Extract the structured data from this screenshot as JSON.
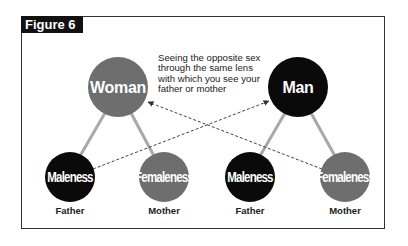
{
  "figure": {
    "title": "Figure 6",
    "caption": "Seeing the opposite sex through the same lens with which you see your father or mother"
  },
  "colors": {
    "gray_node": "#6e6e6e",
    "black_node": "#0a0a0a",
    "connector": "#a8a8a8",
    "arrow": "#444444"
  },
  "nodes": {
    "woman": {
      "label": "Woman",
      "color": "gray"
    },
    "man": {
      "label": "Man",
      "color": "black"
    },
    "left_father": {
      "label": "Maleness",
      "role": "Father",
      "color": "black"
    },
    "left_mother": {
      "label": "Femaleness",
      "role": "Mother",
      "color": "gray"
    },
    "right_father": {
      "label": "Maleness",
      "role": "Father",
      "color": "black"
    },
    "right_mother": {
      "label": "Femaleness",
      "role": "Mother",
      "color": "gray"
    }
  },
  "edges": [
    {
      "from": "woman",
      "to": "left_father",
      "style": "solid"
    },
    {
      "from": "woman",
      "to": "left_mother",
      "style": "solid"
    },
    {
      "from": "man",
      "to": "right_father",
      "style": "solid"
    },
    {
      "from": "man",
      "to": "right_mother",
      "style": "solid"
    },
    {
      "from": "left_father",
      "to": "man",
      "style": "dashed-arrow"
    },
    {
      "from": "right_mother",
      "to": "woman",
      "style": "dashed-arrow"
    }
  ]
}
